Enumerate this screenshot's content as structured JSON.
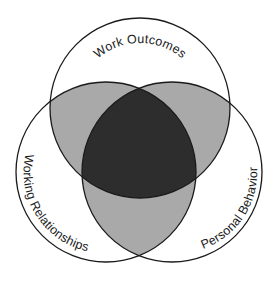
{
  "diagram": {
    "type": "venn",
    "sets": [
      {
        "id": "work",
        "label": "Work Outcomes",
        "cx": 140,
        "cy": 108,
        "r": 90
      },
      {
        "id": "relationships",
        "label": "Working Relationships",
        "cx": 106,
        "cy": 172,
        "r": 90
      },
      {
        "id": "behavior",
        "label": "Personal Behavior",
        "cx": 172,
        "cy": 172,
        "r": 90
      }
    ],
    "colors": {
      "background": "#ffffff",
      "single_region": "#ffffff",
      "pair_overlap": "#a9a9a9",
      "triple_overlap": "#2d2d2d",
      "outline": "#1a1a1a"
    }
  }
}
